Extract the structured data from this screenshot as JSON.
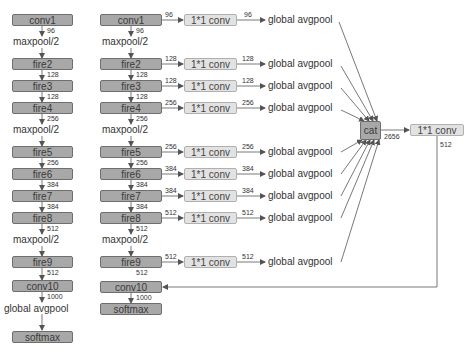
{
  "left_column": {
    "nodes": [
      {
        "id": "conv1",
        "label": "conv1",
        "type": "box"
      },
      {
        "id": "maxpool1",
        "label": "maxpool/2",
        "type": "text"
      },
      {
        "id": "fire2",
        "label": "fire2",
        "type": "box"
      },
      {
        "id": "fire3",
        "label": "fire3",
        "type": "box"
      },
      {
        "id": "fire4",
        "label": "fire4",
        "type": "box"
      },
      {
        "id": "maxpool2",
        "label": "maxpool/2",
        "type": "text"
      },
      {
        "id": "fire5",
        "label": "fire5",
        "type": "box"
      },
      {
        "id": "fire6",
        "label": "fire6",
        "type": "box"
      },
      {
        "id": "fire7",
        "label": "fire7",
        "type": "box"
      },
      {
        "id": "fire8",
        "label": "fire8",
        "type": "box"
      },
      {
        "id": "maxpool3",
        "label": "maxpool/2",
        "type": "text"
      },
      {
        "id": "fire9",
        "label": "fire9",
        "type": "box"
      },
      {
        "id": "conv10",
        "label": "conv10",
        "type": "box"
      },
      {
        "id": "gap",
        "label": "global avgpool",
        "type": "text"
      },
      {
        "id": "softmax",
        "label": "softmax",
        "type": "box"
      }
    ],
    "edge_labels": [
      "96",
      "128",
      "128",
      "256",
      "256",
      "384",
      "384",
      "512",
      "512",
      "1000"
    ]
  },
  "right_column": {
    "nodes": [
      {
        "id": "conv1",
        "label": "conv1"
      },
      {
        "id": "maxpool1",
        "label": "maxpool/2"
      },
      {
        "id": "fire2",
        "label": "fire2"
      },
      {
        "id": "fire3",
        "label": "fire3"
      },
      {
        "id": "fire4",
        "label": "fire4"
      },
      {
        "id": "maxpool2",
        "label": "maxpool/2"
      },
      {
        "id": "fire5",
        "label": "fire5"
      },
      {
        "id": "fire6",
        "label": "fire6"
      },
      {
        "id": "fire7",
        "label": "fire7"
      },
      {
        "id": "fire8",
        "label": "fire8"
      },
      {
        "id": "maxpool3",
        "label": "maxpool/2"
      },
      {
        "id": "fire9",
        "label": "fire9"
      },
      {
        "id": "conv10",
        "label": "conv10"
      },
      {
        "id": "softmax",
        "label": "softmax"
      }
    ],
    "edge_labels": [
      "96",
      "128",
      "128",
      "256",
      "256",
      "384",
      "384",
      "512",
      "512",
      "1000"
    ],
    "branches": [
      {
        "from": "conv1",
        "in": "96",
        "conv": "1*1 conv",
        "out": "96",
        "pool": "global avgpool"
      },
      {
        "from": "fire2",
        "in": "128",
        "conv": "1*1 conv",
        "out": "128",
        "pool": "global avgpool"
      },
      {
        "from": "fire3",
        "in": "128",
        "conv": "1*1 conv",
        "out": "128",
        "pool": "global avgpool"
      },
      {
        "from": "fire4",
        "in": "256",
        "conv": "1*1 conv",
        "out": "256",
        "pool": "global avgpool"
      },
      {
        "from": "fire5",
        "in": "256",
        "conv": "1*1 conv",
        "out": "256",
        "pool": "global avgpool"
      },
      {
        "from": "fire6",
        "in": "384",
        "conv": "1*1 conv",
        "out": "384",
        "pool": "global avgpool"
      },
      {
        "from": "fire7",
        "in": "384",
        "conv": "1*1 conv",
        "out": "384",
        "pool": "global avgpool"
      },
      {
        "from": "fire8",
        "in": "512",
        "conv": "1*1 conv",
        "out": "512",
        "pool": "global avgpool"
      },
      {
        "from": "fire9",
        "in": "512",
        "conv": "1*1 conv",
        "out": "512",
        "pool": "global avgpool"
      }
    ],
    "cat": {
      "label": "cat",
      "out": "2656"
    },
    "final_conv": {
      "label": "1*1 conv",
      "out": "512"
    }
  },
  "colors": {
    "dark_box": "#a8a8a8",
    "light_box": "#e2e2e2",
    "line": "#555555"
  }
}
